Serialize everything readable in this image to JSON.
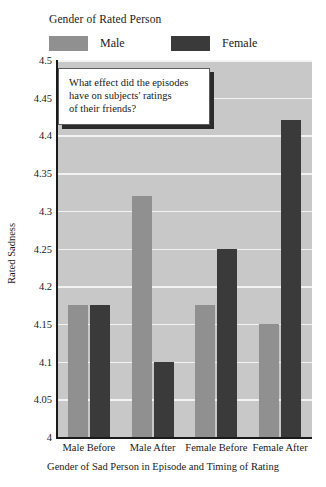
{
  "legend": {
    "title": "Gender of Rated Person",
    "entries": [
      {
        "label": "Male",
        "color": "#909090",
        "swatch_name": "legend-swatch-male"
      },
      {
        "label": "Female",
        "color": "#3a3a3a",
        "swatch_name": "legend-swatch-female"
      }
    ]
  },
  "callout": {
    "text": "What effect did the episodes\nhave on subjects' ratings\nof their friends?"
  },
  "axis": {
    "y_title": "Rated Sadness",
    "x_title": "Gender of Sad Person in Episode and Timing of Rating"
  },
  "chart_data": {
    "type": "bar",
    "title": "",
    "subtitle": "",
    "xlabel": "Gender of Sad Person in Episode and Timing of Rating",
    "ylabel": "Rated Sadness",
    "categories": [
      "Male Before",
      "Male After",
      "Female Before",
      "Female After"
    ],
    "series": [
      {
        "name": "Male",
        "color": "#909090",
        "values": [
          4.175,
          4.32,
          4.175,
          4.15
        ]
      },
      {
        "name": "Female",
        "color": "#3a3a3a",
        "values": [
          4.175,
          4.1,
          4.25,
          4.42
        ]
      }
    ],
    "ylim": [
      4,
      4.5
    ],
    "ytick_labels": [
      "4",
      "4.05",
      "4.1",
      "4.15",
      "4.2",
      "4.25",
      "4.3",
      "4.35",
      "4.4",
      "4.45",
      "4.5"
    ],
    "ytick_values": [
      4,
      4.05,
      4.1,
      4.15,
      4.2,
      4.25,
      4.3,
      4.35,
      4.4,
      4.45,
      4.5
    ],
    "grid": true,
    "grid_color": "#f2f2f2",
    "plot_background": "#c8c8c8",
    "legend_position": "top-left",
    "annotations": [
      "What effect did the episodes have on subjects' ratings of their friends?"
    ]
  }
}
